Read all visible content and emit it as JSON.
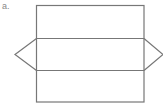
{
  "figure": {
    "label": "a.",
    "stroke_color": "#777777",
    "label_color": "#888888",
    "background": "#ffffff"
  },
  "shapes": {
    "outer_rect": {
      "x": 36,
      "y": 5,
      "width": 108,
      "height": 97
    },
    "divider_top_y": 38,
    "divider_bottom_y": 70,
    "left_triangle": {
      "tip_x": 15,
      "tip_y": 54
    },
    "right_triangle": {
      "tip_x": 163,
      "tip_y": 54
    }
  }
}
